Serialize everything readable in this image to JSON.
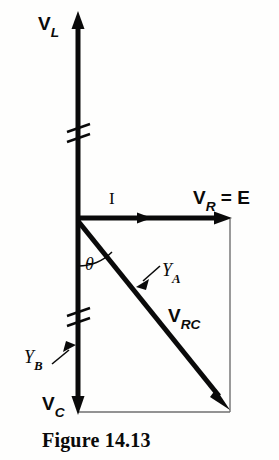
{
  "figure": {
    "caption": "Figure 14.13",
    "type": "phasor-diagram",
    "labels": {
      "v_l_main": "V",
      "v_l_sub": "L",
      "current": "I",
      "v_r_main": "V",
      "v_r_sub": "R",
      "v_r_equals": " = E",
      "theta": "θ",
      "y_a_main": "Y",
      "y_a_sub": "A",
      "v_rc_main": "V",
      "v_rc_sub": "RC",
      "y_b_main": "Y",
      "y_b_sub": "B",
      "v_c_main": "V",
      "v_c_sub": "C"
    },
    "colors": {
      "ink": "#0a0a0a",
      "thin_rule": "#6f6f6f",
      "background": "#fefefd"
    },
    "geometry": {
      "origin": [
        78,
        218
      ],
      "v_l_tip": [
        78,
        14
      ],
      "v_c_tip": [
        78,
        412
      ],
      "v_r_tip": [
        230,
        218
      ],
      "v_rc_tip": [
        228,
        408
      ],
      "axis_break_1_y": 133,
      "axis_break_2_y": 317
    }
  }
}
